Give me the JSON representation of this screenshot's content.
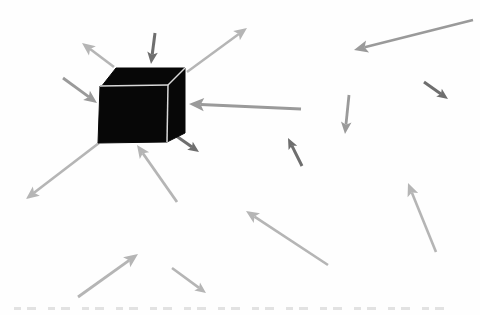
{
  "figure": {
    "background": "#fefefe",
    "palette": {
      "light": "#b5b5b5",
      "medium": "#9a9a9a",
      "dark": "#6e6e6e"
    },
    "cube": {
      "fill": "#070707",
      "edge_highlight": "#d8d8d8",
      "faces": {
        "top": [
          [
            101,
            87
          ],
          [
            116,
            68
          ],
          [
            185,
            68
          ],
          [
            168,
            85
          ]
        ],
        "front": [
          [
            100,
            86
          ],
          [
            168,
            85
          ],
          [
            167,
            142
          ],
          [
            98,
            143
          ]
        ],
        "right": [
          [
            168,
            85
          ],
          [
            185,
            68
          ],
          [
            185,
            133
          ],
          [
            167,
            142
          ]
        ]
      },
      "highlight_edges": [
        [
          [
            100,
            86
          ],
          [
            168,
            85
          ]
        ],
        [
          [
            168,
            85
          ],
          [
            167,
            142
          ]
        ],
        [
          [
            168,
            85
          ],
          [
            185,
            68
          ]
        ]
      ]
    },
    "arrows": [
      {
        "name": "arrow-out-top-left",
        "x1": 114,
        "y1": 67,
        "x2": 82,
        "y2": 43,
        "tone": "light",
        "head": 13,
        "w": 2.6
      },
      {
        "name": "arrow-in-top-down",
        "x1": 155,
        "y1": 33,
        "x2": 151,
        "y2": 64,
        "tone": "dark",
        "head": 12,
        "w": 3
      },
      {
        "name": "arrow-in-left",
        "x1": 63,
        "y1": 78,
        "x2": 97,
        "y2": 103,
        "tone": "medium",
        "head": 13,
        "w": 2.8
      },
      {
        "name": "arrow-out-top-right",
        "x1": 187,
        "y1": 72,
        "x2": 247,
        "y2": 28,
        "tone": "light",
        "head": 13,
        "w": 2.4
      },
      {
        "name": "arrow-in-right-long",
        "x1": 301,
        "y1": 109,
        "x2": 189,
        "y2": 104,
        "tone": "medium",
        "head": 15,
        "w": 3
      },
      {
        "name": "arrow-out-bottom-right-dark",
        "x1": 172,
        "y1": 133,
        "x2": 199,
        "y2": 152,
        "tone": "dark",
        "head": 11,
        "w": 3
      },
      {
        "name": "arrow-in-bottom",
        "x1": 177,
        "y1": 202,
        "x2": 137,
        "y2": 145,
        "tone": "light",
        "head": 13,
        "w": 2.8
      },
      {
        "name": "arrow-out-bottom-left-long",
        "x1": 99,
        "y1": 143,
        "x2": 26,
        "y2": 199,
        "tone": "light",
        "head": 13,
        "w": 2.6
      },
      {
        "name": "arrow-far-top-right-long",
        "x1": 473,
        "y1": 20,
        "x2": 354,
        "y2": 50,
        "tone": "medium",
        "head": 14,
        "w": 2.6
      },
      {
        "name": "arrow-mid-down",
        "x1": 349,
        "y1": 95,
        "x2": 345,
        "y2": 134,
        "tone": "medium",
        "head": 12,
        "w": 2.8
      },
      {
        "name": "arrow-mid-up-left-dark",
        "x1": 302,
        "y1": 166,
        "x2": 288,
        "y2": 138,
        "tone": "dark",
        "head": 11,
        "w": 3
      },
      {
        "name": "arrow-right-down-dark",
        "x1": 424,
        "y1": 82,
        "x2": 448,
        "y2": 99,
        "tone": "dark",
        "head": 11,
        "w": 3
      },
      {
        "name": "arrow-bottom-up-right",
        "x1": 78,
        "y1": 297,
        "x2": 138,
        "y2": 254,
        "tone": "light",
        "head": 14,
        "w": 2.8
      },
      {
        "name": "arrow-bottom-small-down-right",
        "x1": 172,
        "y1": 268,
        "x2": 206,
        "y2": 293,
        "tone": "light",
        "head": 11,
        "w": 2.6
      },
      {
        "name": "arrow-bottom-right-up-left",
        "x1": 328,
        "y1": 265,
        "x2": 246,
        "y2": 211,
        "tone": "light",
        "head": 13,
        "w": 2.6
      },
      {
        "name": "arrow-bottom-right-up",
        "x1": 436,
        "y1": 252,
        "x2": 408,
        "y2": 183,
        "tone": "light",
        "head": 13,
        "w": 2.6
      }
    ],
    "caption_strip": {
      "color": "#d9d9d9",
      "x": 14,
      "y": 306,
      "width": 430
    }
  }
}
